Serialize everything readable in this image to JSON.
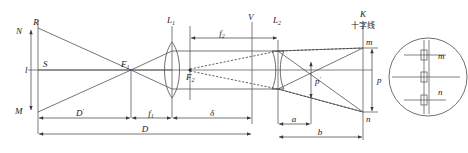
{
  "figure": {
    "kind": "optics-ray-diagram",
    "background": "#ffffff",
    "line_color": "#3a3a3a"
  },
  "labels": {
    "object_top": "R",
    "object_top_outer": "N",
    "object_axis": "S",
    "object_bottom": "M",
    "object_height": "l",
    "focus_1": "F",
    "focus_1_sub": "1",
    "lens_1": "L",
    "lens_1_sub": "1",
    "lens_2": "L",
    "lens_2_sub": "2",
    "focus_2": "F",
    "focus_2_sub": "2",
    "vertex_v": "V",
    "screen_k": "K",
    "screen_k_cjk": "十字线",
    "image_top": "m",
    "image_bottom": "n",
    "detail_top": "m",
    "detail_bottom": "n",
    "dim_image_p": "p",
    "dim_image_pprime": "p",
    "dim_image_pprime_mark": "′"
  },
  "dimensions": [
    {
      "name": "D-prime",
      "label": "D",
      "prime": "′",
      "from": "object-plane",
      "to": "F1"
    },
    {
      "name": "f1",
      "label": "f",
      "sub": "1",
      "from": "F1",
      "to": "L1"
    },
    {
      "name": "delta",
      "label": "δ",
      "from": "L1",
      "to": "V"
    },
    {
      "name": "D",
      "label": "D",
      "from": "object-plane",
      "to": "V"
    },
    {
      "name": "f2",
      "label": "f",
      "sub": "2",
      "from": "F2",
      "to": "L2"
    },
    {
      "name": "a",
      "label": "a",
      "from": "L2",
      "to": "virtual-image"
    },
    {
      "name": "b",
      "label": "b",
      "from": "L2",
      "to": "K"
    },
    {
      "name": "p",
      "label": "p",
      "from": "n",
      "to": "m"
    },
    {
      "name": "p-prime",
      "label": "p′",
      "from": "virtual-n",
      "to": "virtual-m"
    },
    {
      "name": "l",
      "label": "l",
      "from": "M",
      "to": "N"
    }
  ],
  "geometry": {
    "axis_y": 70,
    "object_x": 38,
    "object_top_y": 28,
    "object_bottom_y": 112,
    "F1_x": 131,
    "L1_x": 172,
    "V_x": 252,
    "L2_x": 278,
    "F2_x": 190,
    "K_x": 363,
    "image_top_y": 48,
    "image_bottom_y": 112,
    "detail_circle_cx": 428,
    "detail_circle_cy": 77,
    "detail_circle_r": 40
  },
  "detail_view": {
    "name": "eyepiece-reticle-view",
    "tick_rows": 3,
    "scale_lines": 2
  }
}
